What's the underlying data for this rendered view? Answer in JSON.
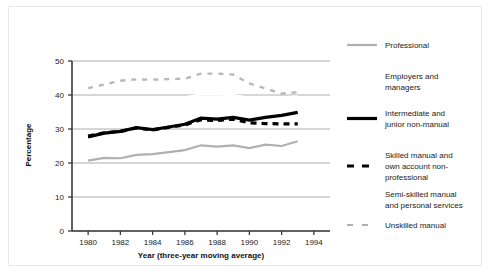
{
  "chart_data": {
    "type": "line",
    "title": "",
    "subtitle": "",
    "xlabel": "Year (three-year moving average)",
    "ylabel": "Percentage",
    "xlim": [
      1979,
      1995
    ],
    "ylim": [
      0,
      50
    ],
    "xticks": [
      1980,
      1982,
      1984,
      1986,
      1988,
      1990,
      1992,
      1994
    ],
    "xtick_labels": [
      "1980",
      "1982",
      "1984",
      "1986",
      "1988",
      "1990",
      "1992",
      "1994"
    ],
    "yticks": [
      0,
      10,
      20,
      30,
      40,
      50
    ],
    "ytick_labels": [
      "0",
      "10",
      "20",
      "30",
      "40",
      "50"
    ],
    "grid": true,
    "grid_axis": "y",
    "legend_position": "right",
    "x": [
      1980,
      1981,
      1982,
      1983,
      1984,
      1985,
      1986,
      1987,
      1988,
      1989,
      1990,
      1991,
      1992,
      1993
    ],
    "series": [
      {
        "name": "Professional",
        "style": "solid",
        "color": "#b0b0b0",
        "width": 2.2,
        "values": [
          20.7,
          21.5,
          21.4,
          22.4,
          22.6,
          23.2,
          23.8,
          25.2,
          24.8,
          25.2,
          24.4,
          25.4,
          25.0,
          26.4
        ]
      },
      {
        "name": "Employers and managers",
        "style": "solid",
        "color": "#ffffff",
        "width": 2.2,
        "values": [
          37.6,
          38.2,
          38.9,
          39.3,
          39.1,
          39.0,
          39.3,
          40.2,
          40.1,
          40.0,
          39.2,
          39.4,
          39.3,
          39.6
        ]
      },
      {
        "name": "Intermediate and junior non-manual",
        "style": "solid",
        "color": "#000000",
        "width": 3.2,
        "values": [
          27.7,
          28.8,
          29.3,
          30.4,
          29.8,
          30.6,
          31.4,
          33.2,
          32.9,
          33.4,
          32.6,
          33.4,
          34.0,
          34.9
        ]
      },
      {
        "name": "Skilled manual and own account non-professional",
        "style": "dashed",
        "color": "#000000",
        "width": 3.2,
        "values": [
          27.9,
          28.9,
          29.3,
          30.3,
          29.7,
          30.5,
          31.2,
          32.7,
          32.5,
          32.9,
          31.8,
          31.6,
          31.5,
          31.5
        ]
      },
      {
        "name": "Semi-skilled manual and personal services",
        "style": "solid",
        "color": "#ffffff",
        "width": 2.2,
        "values": [
          36.6,
          37.2,
          37.9,
          38.3,
          38.1,
          38.0,
          38.2,
          39.0,
          38.9,
          38.8,
          38.1,
          38.2,
          38.1,
          38.4
        ]
      },
      {
        "name": "Unskilled manual",
        "style": "dashed",
        "color": "#b8b8b8",
        "width": 2.4,
        "values": [
          42.0,
          43.1,
          44.2,
          44.6,
          44.5,
          44.7,
          44.8,
          46.3,
          46.3,
          46.0,
          43.4,
          41.9,
          40.4,
          40.8
        ]
      }
    ]
  },
  "legend": {
    "entries": [
      {
        "label": "Professional",
        "swatch": "solid-gray"
      },
      {
        "label": "Employers and managers",
        "swatch": "none"
      },
      {
        "label": "Intermediate and junior non-manual",
        "swatch": "solid-black"
      },
      {
        "label": "Skilled manual and own account non-professional",
        "swatch": "dashed-black"
      },
      {
        "label": "Semi-skilled manual and personal services",
        "swatch": "none"
      },
      {
        "label": "Unskilled manual",
        "swatch": "dashed-gray"
      }
    ],
    "lines": [
      [
        "Professional"
      ],
      [
        "Employers and",
        "managers"
      ],
      [
        "Intermediate and",
        "junior non-manual"
      ],
      [
        "Skilled manual and",
        "own account non-",
        "professional"
      ],
      [
        "Semi-skilled manual",
        "and personal services"
      ],
      [
        "Unskilled manual"
      ]
    ]
  },
  "colors": {
    "axis": "#3a3a3a",
    "grid": "#8a8a8a",
    "text": "#1a1a1a",
    "series_gray": "#b0b0b0",
    "series_black": "#000000",
    "background": "#ffffff",
    "frame": "#e8e8e8"
  }
}
